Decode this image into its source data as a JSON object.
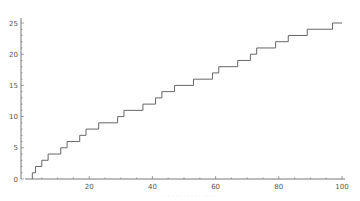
{
  "chart_data": {
    "type": "line",
    "subtype": "step",
    "title": "",
    "xlabel": "",
    "ylabel": "",
    "xlim": [
      0,
      100
    ],
    "ylim": [
      0,
      25
    ],
    "x_ticks": [
      20,
      40,
      60,
      80,
      100
    ],
    "y_ticks": [
      0,
      5,
      10,
      15,
      20,
      25
    ],
    "grid": false,
    "legend": null,
    "series": [
      {
        "name": "prime counting function",
        "color": "#666666",
        "x": [
          2,
          3,
          5,
          7,
          11,
          13,
          17,
          19,
          23,
          29,
          31,
          37,
          41,
          43,
          47,
          53,
          59,
          61,
          67,
          71,
          73,
          79,
          83,
          89,
          97,
          100
        ],
        "values": [
          1,
          2,
          3,
          4,
          5,
          6,
          7,
          8,
          9,
          10,
          11,
          12,
          13,
          14,
          15,
          16,
          17,
          18,
          19,
          20,
          21,
          22,
          23,
          24,
          25,
          25
        ]
      }
    ]
  },
  "axes": {
    "x_tick_labels": [
      "20",
      "40",
      "60",
      "80",
      "100"
    ],
    "y_tick_labels": [
      "0",
      "5",
      "10",
      "15",
      "20",
      "25"
    ]
  },
  "caption": "· · · · · · · · · · · · · ·"
}
